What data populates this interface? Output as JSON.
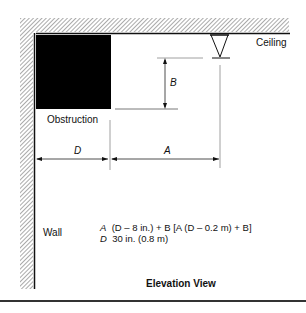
{
  "diagram": {
    "labels": {
      "ceiling": "Ceiling",
      "obstruction": "Obstruction",
      "wall": "Wall",
      "dim_a": "A",
      "dim_b": "B",
      "dim_d": "D",
      "title": "Elevation View"
    },
    "equations": {
      "line1_var": "A",
      "line1_expr": "(D – 8 in.) + B [A   (D – 0.2 m) + B]",
      "line2_var": "D",
      "line2_expr": "30 in. (0.8 m)"
    },
    "colors": {
      "ink": "#111111",
      "obstruction_fill": "#000000",
      "guide": "#999999"
    }
  }
}
